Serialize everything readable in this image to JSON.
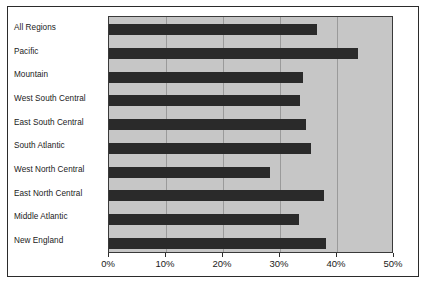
{
  "chart_data": {
    "type": "bar",
    "orientation": "horizontal",
    "title": "",
    "subtitle": "",
    "xlabel": "",
    "ylabel": "",
    "categories": [
      "All Regions",
      "Pacific",
      "Mountain",
      "West South Central",
      "East South Central",
      "South Atlantic",
      "West North Central",
      "East North Central",
      "Middle Atlantic",
      "New England"
    ],
    "values": [
      36.5,
      43.7,
      34.0,
      33.5,
      34.5,
      35.5,
      28.3,
      37.7,
      33.3,
      38.0
    ],
    "value_unit": "%",
    "xlim": [
      0,
      50
    ],
    "xticks": [
      0,
      10,
      20,
      30,
      40,
      50
    ],
    "xtick_labels": [
      "0%",
      "10%",
      "20%",
      "30%",
      "40%",
      "50%"
    ],
    "grid": true,
    "grid_axis": "x",
    "legend": null,
    "legend_position": "none",
    "annotations": [],
    "colors": {
      "bar": "#2a2a2a",
      "plot_background": "#c6c6c6",
      "gridline": "#9a9a9a",
      "frame": "#2b2b2b",
      "figure_background": "#ffffff",
      "text": "#1a1a1a"
    }
  }
}
